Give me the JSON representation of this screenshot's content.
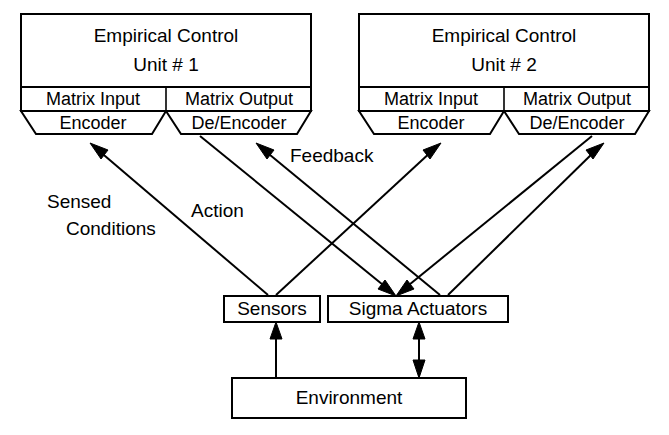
{
  "diagram": {
    "stroke_color": "#000000",
    "fill_color": "#ffffff",
    "units": [
      {
        "id": "unit-1",
        "header_line1": "Empirical Control",
        "header_line2": "Unit # 1",
        "left_cell": "Matrix Input",
        "right_cell": "Matrix Output",
        "left_trapezoid": "Encoder",
        "right_trapezoid": "De/Encoder"
      },
      {
        "id": "unit-2",
        "header_line1": "Empirical Control",
        "header_line2": "Unit # 2",
        "left_cell": "Matrix Input",
        "right_cell": "Matrix Output",
        "left_trapezoid": "Encoder",
        "right_trapezoid": "De/Encoder"
      }
    ],
    "boxes": {
      "sensors": "Sensors",
      "actuators": "Sigma Actuators",
      "environment": "Environment"
    },
    "edge_labels": {
      "sensed_conditions_line1": "Sensed",
      "sensed_conditions_line2": "Conditions",
      "action": "Action",
      "feedback": "Feedback"
    }
  }
}
